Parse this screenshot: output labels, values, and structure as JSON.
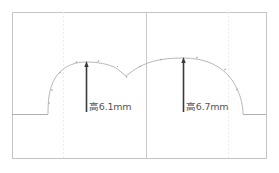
{
  "diagram": {
    "type": "profile-height-measurement",
    "colors": {
      "frame": "#bdbdbd",
      "guide": "#e2e2e2",
      "profile": "#b8b8b8",
      "arrow": "#3a3a3a",
      "label": "#555555"
    },
    "measurements": [
      {
        "id": "left-peak",
        "label": "高6.1mm",
        "value_mm": 6.1
      },
      {
        "id": "right-peak",
        "label": "高6.7mm",
        "value_mm": 6.7
      }
    ]
  }
}
